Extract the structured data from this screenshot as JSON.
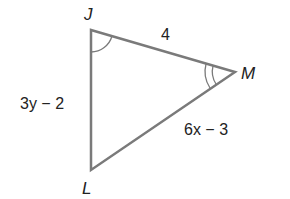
{
  "diagram": {
    "type": "triangle",
    "vertices": [
      {
        "name": "J",
        "x": 91,
        "y": 30
      },
      {
        "name": "M",
        "x": 235,
        "y": 72
      },
      {
        "name": "L",
        "x": 91,
        "y": 170
      }
    ],
    "labels": {
      "J": "J",
      "M": "M",
      "L": "L"
    },
    "sides": {
      "JM": "4",
      "JL": "3y − 2",
      "LM": "6x − 3"
    },
    "angle_marks": {
      "J": 1,
      "M": 2
    },
    "line_color": "#7a7a7a"
  }
}
